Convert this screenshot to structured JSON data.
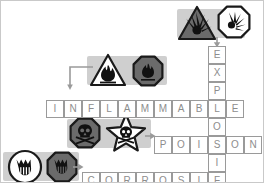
{
  "worksheet": {
    "title": "Hazard Pictogram Crossword",
    "background_color": "#ffffff",
    "cell_border_color": "#9a9a9a",
    "letter_color": "#8d8d8d",
    "highlight_color": "#cfcfcf",
    "pictogram_dark": "#6b6b6b",
    "pictogram_light": "#ffffff",
    "pictogram_outline": "#1a1a1a"
  },
  "crossword": {
    "cell_size": 18,
    "entries": [
      {
        "id": "explosif",
        "word": "EXPLOSIF",
        "direction": "vertical",
        "letters": [
          "E",
          "X",
          "P",
          "L",
          "O",
          "S",
          "I",
          "F"
        ],
        "start_x": 207,
        "start_y": 45
      },
      {
        "id": "inflammable",
        "word": "INFLAMMABLE",
        "direction": "horizontal",
        "letters": [
          "I",
          "N",
          "F",
          "L",
          "A",
          "M",
          "M",
          "A",
          "B",
          "L",
          "E"
        ],
        "start_x": 60,
        "start_y": 90,
        "shared_index": 9,
        "shared_letter": "L"
      },
      {
        "id": "poison",
        "word": "POISON",
        "direction": "horizontal",
        "letters": [
          "P",
          "O",
          "I",
          "S",
          "O",
          "N"
        ],
        "start_x": 153,
        "start_y": 126,
        "shared_index": 3,
        "shared_letter": "S"
      },
      {
        "id": "corrosif",
        "word": "CORROSIF",
        "direction": "horizontal",
        "letters": [
          "C",
          "O",
          "R",
          "R",
          "O",
          "S",
          "I",
          "F"
        ],
        "start_x": 81,
        "start_y": 157,
        "shared_index": 7,
        "shared_letter": "F"
      }
    ]
  },
  "pictogram_groups": [
    {
      "id": "explosive",
      "hazard_label": "EXPLOSIF",
      "symbols": [
        {
          "name": "explosive-triangle-pictogram",
          "shape": "triangle",
          "fill": "dark",
          "glyph": "exploding-bomb"
        },
        {
          "name": "explosive-octagon-pictogram",
          "shape": "octagon",
          "fill": "light",
          "glyph": "exploding-bomb"
        }
      ],
      "arrow": {
        "name": "arrow-explosive-to-grid",
        "style": "straight-down"
      }
    },
    {
      "id": "flammable",
      "hazard_label": "INFLAMMABLE",
      "symbols": [
        {
          "name": "flammable-triangle-pictogram",
          "shape": "triangle",
          "fill": "light",
          "glyph": "flame"
        },
        {
          "name": "flammable-octagon-pictogram",
          "shape": "octagon",
          "fill": "dark",
          "glyph": "flame"
        }
      ],
      "arrow": {
        "name": "arrow-flammable-to-grid",
        "style": "elbow-left-down"
      }
    },
    {
      "id": "poison",
      "hazard_label": "POISON",
      "symbols": [
        {
          "name": "poison-octagon-pictogram",
          "shape": "octagon",
          "fill": "dark",
          "glyph": "skull-and-crossbones"
        },
        {
          "name": "poison-star-pictogram",
          "shape": "star",
          "fill": "light",
          "glyph": "skull-and-crossbones"
        }
      ],
      "arrow": {
        "name": "arrow-poison-to-grid",
        "style": "straight-right"
      }
    },
    {
      "id": "corrosive",
      "hazard_label": "CORROSIF",
      "symbols": [
        {
          "name": "corrosive-circle-pictogram",
          "shape": "circle",
          "fill": "light",
          "glyph": "corroding-hand"
        },
        {
          "name": "corrosive-octagon-pictogram",
          "shape": "octagon",
          "fill": "dark",
          "glyph": "corroding-hand"
        }
      ],
      "arrow": {
        "name": "arrow-corrosive-to-grid",
        "style": "straight-right"
      }
    }
  ]
}
